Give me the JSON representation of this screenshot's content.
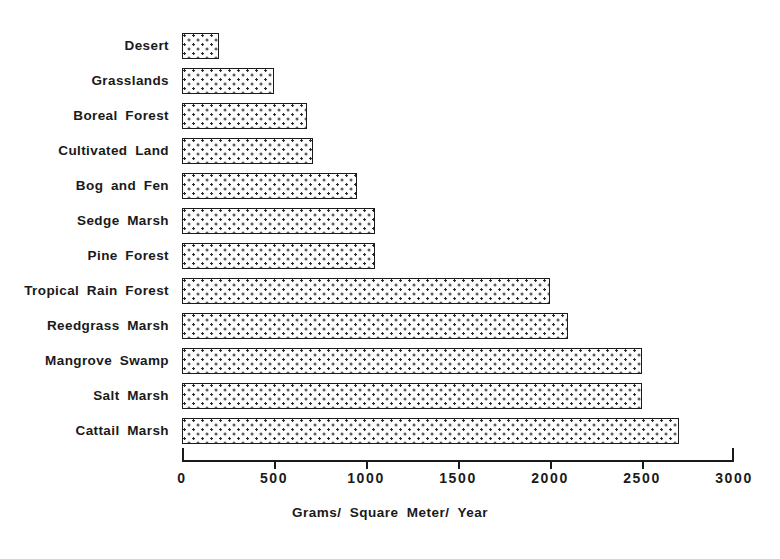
{
  "chart_data": {
    "type": "bar",
    "orientation": "horizontal",
    "title": "",
    "xlabel": "Grams/ Square Meter/ Year",
    "ylabel": "",
    "xlim": [
      0,
      3000
    ],
    "grid": false,
    "legend": null,
    "categories": [
      "Desert",
      "Grasslands",
      "Boreal Forest",
      "Cultivated Land",
      "Bog and Fen",
      "Sedge Marsh",
      "Pine Forest",
      "Tropical Rain Forest",
      "Reedgrass Marsh",
      "Mangrove Swamp",
      "Salt Marsh",
      "Cattail Marsh"
    ],
    "values": [
      200,
      500,
      680,
      710,
      950,
      1050,
      1050,
      2000,
      2100,
      2500,
      2500,
      2700
    ],
    "xticks": [
      0,
      500,
      1000,
      1500,
      2000,
      2500,
      3000
    ],
    "xtick_labels": [
      "0",
      "500",
      "1000",
      "1500",
      "2000",
      "2500",
      "3000"
    ],
    "bar_fill": "dotted-stipple",
    "bar_edge_color": "#1a1a1a",
    "background_color": "#ffffff"
  }
}
